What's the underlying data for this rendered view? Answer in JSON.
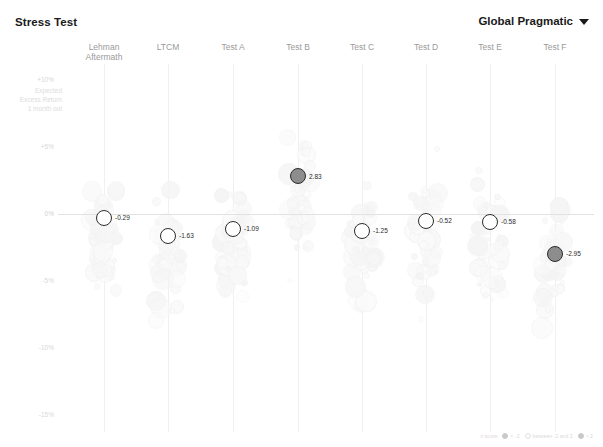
{
  "header": {
    "title": "Stress Test",
    "portfolio": "Global Pragmatic",
    "caret_icon": "chevron-down-icon"
  },
  "axis": {
    "caption": "Expected\nExcess Return\n1 month out",
    "caption_line1": "Expected",
    "caption_line2": "Excess Return",
    "caption_line3": "1 month out",
    "ticks": [
      "+10%",
      "+5%",
      "0%",
      "-5%",
      "-10%",
      "-15%"
    ],
    "tick_values": [
      10,
      5,
      0,
      -5,
      -10,
      -15
    ],
    "ymin": -17,
    "ymax": 12
  },
  "legend": {
    "title": "z-score",
    "items": [
      {
        "label": "< -2",
        "swatch": "dark"
      },
      {
        "label": "between -2 and 2",
        "swatch": "light"
      },
      {
        "label": "> 2",
        "swatch": "dark"
      }
    ]
  },
  "chart_data": {
    "type": "scatter",
    "title": "Stress Test",
    "xlabel": "",
    "ylabel": "Expected Excess Return 1 month out",
    "ylim": [
      -17,
      12
    ],
    "grid": false,
    "legend_position": "bottom-right",
    "categories": [
      "Lehman Aftermath",
      "LTCM",
      "Test A",
      "Test B",
      "Test C",
      "Test D",
      "Test E",
      "Test F"
    ],
    "category_labels": [
      [
        "Lehman",
        "Aftermath"
      ],
      [
        "LTCM"
      ],
      [
        "Test A"
      ],
      [
        "Test B"
      ],
      [
        "Test C"
      ],
      [
        "Test D"
      ],
      [
        "Test E"
      ],
      [
        "Test F"
      ]
    ],
    "series": [
      {
        "name": "Portfolio expected excess return",
        "values": [
          -0.29,
          -1.63,
          -1.09,
          2.83,
          -1.25,
          -0.52,
          -0.58,
          -2.95
        ],
        "labels": [
          "-0.29",
          "-1.63",
          "-1.09",
          "2.83",
          "-1.25",
          "-0.52",
          "-0.58",
          "-2.95"
        ]
      }
    ]
  }
}
